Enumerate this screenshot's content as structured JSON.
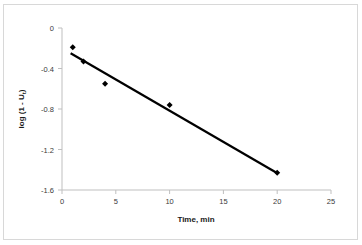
{
  "chart_data": {
    "type": "scatter",
    "title": "",
    "xlabel": "Time, min",
    "ylabel": "log (1 - U₁)",
    "ylabel_parts": {
      "main": "log (1 - U",
      "sub": "t",
      "close": ")"
    },
    "xlim": [
      0,
      25
    ],
    "ylim": [
      -1.6,
      0
    ],
    "xticks": [
      0,
      5,
      10,
      15,
      20,
      25
    ],
    "yticks": [
      0,
      -0.4,
      -0.8,
      -1.2,
      -1.6
    ],
    "xtick_labels": [
      "0",
      "5",
      "10",
      "15",
      "20",
      "25"
    ],
    "ytick_labels": [
      "0",
      "-0.4",
      "-0.8",
      "-1.2",
      "-1.6"
    ],
    "grid": false,
    "legend": "none",
    "series": [
      {
        "name": "data points",
        "kind": "scatter",
        "marker": "diamond",
        "color": "#000000",
        "x": [
          1,
          2,
          4,
          10,
          20
        ],
        "y": [
          -0.19,
          -0.33,
          -0.55,
          -0.76,
          -1.43
        ]
      },
      {
        "name": "trendline",
        "kind": "line",
        "color": "#000000",
        "x": [
          0.8,
          20.1
        ],
        "y": [
          -0.25,
          -1.44
        ]
      }
    ],
    "colors": {
      "marker": "#000000",
      "line": "#000000",
      "axis": "#bfbfbf",
      "tick_label": "#3a3a3a",
      "border": "#d8d8d8",
      "background": "#ffffff"
    }
  }
}
